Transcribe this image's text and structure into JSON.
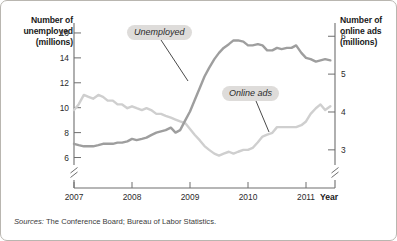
{
  "chart_data": {
    "type": "line",
    "title": "",
    "subtitle": "",
    "xlabel": "Year",
    "grid": false,
    "legend_position": "inline-annotations",
    "x_tick_labels": [
      "2007",
      "2008",
      "2009",
      "2010",
      "2011"
    ],
    "x_tick_values": [
      2007,
      2008,
      2009,
      2010,
      2011
    ],
    "xlim": [
      2007,
      2011.5
    ],
    "left_axis": {
      "label": "Number of unemployed (millions)",
      "label_line1": "Number of",
      "label_line2": "unemployed",
      "label_line3": "(millions)",
      "tick_labels": [
        "16",
        "14",
        "12",
        "10",
        "8",
        "6"
      ],
      "tick_values": [
        16,
        14,
        12,
        10,
        8,
        6
      ],
      "ylim": [
        5.4,
        16.8
      ],
      "axis_break": true
    },
    "right_axis": {
      "label": "Number of online ads (millions)",
      "label_line1": "Number of",
      "label_line2": "online ads",
      "label_line3": "(millions)",
      "tick_labels": [
        "6",
        "5",
        "4",
        "3"
      ],
      "tick_values": [
        6,
        5,
        4,
        3
      ],
      "ylim": [
        2.6,
        6.35
      ],
      "axis_break": true
    },
    "series": [
      {
        "name": "Unemployed",
        "axis": "left",
        "color": "#9e9e9e",
        "units": "millions",
        "x": [
          2007.0,
          2007.08,
          2007.17,
          2007.25,
          2007.33,
          2007.42,
          2007.5,
          2007.58,
          2007.67,
          2007.75,
          2007.83,
          2007.92,
          2008.0,
          2008.08,
          2008.17,
          2008.25,
          2008.33,
          2008.42,
          2008.5,
          2008.58,
          2008.67,
          2008.75,
          2008.83,
          2008.92,
          2009.0,
          2009.08,
          2009.17,
          2009.25,
          2009.33,
          2009.42,
          2009.5,
          2009.58,
          2009.67,
          2009.75,
          2009.83,
          2009.92,
          2010.0,
          2010.08,
          2010.17,
          2010.25,
          2010.33,
          2010.42,
          2010.5,
          2010.58,
          2010.67,
          2010.75,
          2010.83,
          2010.92,
          2011.0,
          2011.08,
          2011.17,
          2011.25,
          2011.33,
          2011.42
        ],
        "y": [
          7.1,
          7.0,
          6.9,
          6.9,
          6.9,
          7.0,
          7.1,
          7.1,
          7.1,
          7.2,
          7.2,
          7.3,
          7.5,
          7.4,
          7.5,
          7.6,
          7.8,
          8.0,
          8.1,
          8.2,
          8.4,
          8.0,
          8.2,
          9.0,
          9.7,
          10.6,
          11.6,
          12.5,
          13.2,
          13.9,
          14.4,
          14.8,
          15.1,
          15.4,
          15.4,
          15.3,
          15.0,
          15.0,
          15.1,
          15.0,
          14.6,
          14.6,
          14.8,
          14.7,
          14.8,
          14.8,
          15.0,
          14.4,
          14.0,
          13.9,
          13.7,
          13.8,
          13.9,
          13.8
        ],
        "max_value": 15.4,
        "min_value": 6.9
      },
      {
        "name": "Online ads",
        "axis": "right",
        "color": "#cfcfcf",
        "units": "millions",
        "x": [
          2007.0,
          2007.08,
          2007.17,
          2007.25,
          2007.33,
          2007.42,
          2007.5,
          2007.58,
          2007.67,
          2007.75,
          2007.83,
          2007.92,
          2008.0,
          2008.08,
          2008.17,
          2008.25,
          2008.33,
          2008.42,
          2008.5,
          2008.58,
          2008.67,
          2008.75,
          2008.83,
          2008.92,
          2009.0,
          2009.08,
          2009.17,
          2009.25,
          2009.33,
          2009.42,
          2009.5,
          2009.58,
          2009.67,
          2009.75,
          2009.83,
          2009.92,
          2010.0,
          2010.08,
          2010.17,
          2010.25,
          2010.33,
          2010.42,
          2010.5,
          2010.58,
          2010.67,
          2010.75,
          2010.83,
          2010.92,
          2011.0,
          2011.08,
          2011.17,
          2011.25,
          2011.33,
          2011.42
        ],
        "y": [
          4.05,
          4.2,
          4.45,
          4.4,
          4.35,
          4.45,
          4.4,
          4.3,
          4.3,
          4.2,
          4.2,
          4.1,
          4.15,
          4.1,
          4.05,
          4.1,
          4.05,
          3.95,
          3.95,
          3.9,
          3.85,
          3.8,
          3.75,
          3.7,
          3.55,
          3.4,
          3.25,
          3.1,
          3.0,
          2.9,
          2.85,
          2.9,
          2.95,
          2.9,
          2.95,
          3.0,
          3.0,
          3.05,
          3.2,
          3.35,
          3.4,
          3.45,
          3.6,
          3.6,
          3.6,
          3.6,
          3.6,
          3.65,
          3.75,
          3.95,
          4.1,
          4.2,
          4.05,
          4.15
        ],
        "max_value": 4.45,
        "min_value": 2.85
      }
    ],
    "annotations": [
      {
        "text": "Unemployed",
        "series": "Unemployed"
      },
      {
        "text": "Online ads",
        "series": "Online ads"
      }
    ],
    "source_note": {
      "prefix": "Sources:",
      "text": "The Conference Board; Bureau of Labor Statistics."
    }
  },
  "colors": {
    "unemployed_line": "#9e9e9e",
    "online_ads_line": "#cfcfcf",
    "axis": "#6e6e6e",
    "label_box": "#dedcda",
    "frame_border": "#b9b6b0"
  }
}
